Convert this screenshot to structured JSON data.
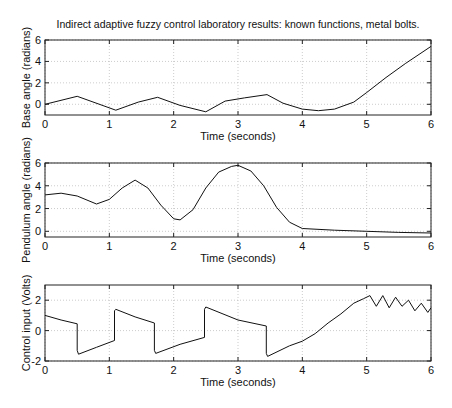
{
  "chart_data": [
    {
      "type": "line",
      "title": "Indirect adaptive fuzzy control laboratory results: known functions, metal bolts.",
      "xlabel": "Time (seconds)",
      "ylabel": "Base angle (radians)",
      "xlim": [
        0,
        6
      ],
      "ylim": [
        -1,
        6
      ],
      "xticks": [
        0,
        1,
        2,
        3,
        4,
        5,
        6
      ],
      "yticks": [
        0,
        2,
        4,
        6
      ],
      "grid": true,
      "series": [
        {
          "name": "Base angle",
          "x": [
            0,
            0.5,
            1.1,
            1.45,
            1.75,
            2.1,
            2.5,
            2.8,
            3.1,
            3.45,
            3.7,
            4.0,
            4.25,
            4.5,
            4.8,
            5.0,
            5.3,
            5.6,
            6.0
          ],
          "y": [
            0.0,
            0.75,
            -0.55,
            0.2,
            0.65,
            -0.1,
            -0.7,
            0.3,
            0.6,
            0.9,
            0.1,
            -0.45,
            -0.6,
            -0.45,
            0.2,
            1.1,
            2.5,
            3.8,
            5.4
          ]
        }
      ]
    },
    {
      "type": "line",
      "title": "",
      "xlabel": "Time (seconds)",
      "ylabel": "Pendulum angle (radians)",
      "xlim": [
        0,
        6
      ],
      "ylim": [
        -0.5,
        6
      ],
      "xticks": [
        0,
        1,
        2,
        3,
        4,
        5,
        6
      ],
      "yticks": [
        0,
        2,
        4,
        6
      ],
      "grid": true,
      "series": [
        {
          "name": "Pendulum angle",
          "x": [
            0,
            0.25,
            0.5,
            0.8,
            1.0,
            1.2,
            1.4,
            1.6,
            1.8,
            2.0,
            2.1,
            2.3,
            2.5,
            2.7,
            2.9,
            3.0,
            3.2,
            3.4,
            3.6,
            3.8,
            4.0,
            4.5,
            5.0,
            5.5,
            6.0
          ],
          "y": [
            3.2,
            3.35,
            3.1,
            2.4,
            2.8,
            3.8,
            4.5,
            3.8,
            2.3,
            1.1,
            1.0,
            1.9,
            3.8,
            5.2,
            5.7,
            5.8,
            5.3,
            4.0,
            2.1,
            0.8,
            0.25,
            0.1,
            0.0,
            -0.1,
            -0.15
          ]
        }
      ]
    },
    {
      "type": "line",
      "title": "",
      "xlabel": "Time (seconds)",
      "ylabel": "Control input (Volts)",
      "xlim": [
        0,
        6
      ],
      "ylim": [
        -2,
        3
      ],
      "xticks": [
        0,
        1,
        2,
        3,
        4,
        5,
        6
      ],
      "yticks": [
        -2,
        0,
        2
      ],
      "grid": true,
      "series": [
        {
          "name": "Control input",
          "x": [
            0,
            0.25,
            0.5,
            0.5,
            0.52,
            0.8,
            1.08,
            1.08,
            1.1,
            1.4,
            1.7,
            1.7,
            1.72,
            2.1,
            2.48,
            2.48,
            2.5,
            3.0,
            3.44,
            3.44,
            3.46,
            3.8,
            4.0,
            4.2,
            4.4,
            4.6,
            4.8,
            4.95,
            5.05,
            5.15,
            5.25,
            5.35,
            5.45,
            5.55,
            5.65,
            5.75,
            5.85,
            5.95,
            6.0
          ],
          "y": [
            1.0,
            0.7,
            0.45,
            -1.3,
            -1.55,
            -1.1,
            -0.65,
            1.3,
            1.4,
            0.9,
            0.5,
            -1.3,
            -1.5,
            -0.9,
            -0.45,
            1.4,
            1.55,
            0.7,
            0.3,
            -1.5,
            -1.7,
            -1.0,
            -0.7,
            -0.2,
            0.5,
            1.1,
            1.8,
            2.1,
            2.3,
            1.6,
            2.3,
            1.5,
            2.2,
            1.6,
            2.0,
            1.3,
            1.8,
            1.2,
            1.5
          ]
        }
      ]
    }
  ],
  "labels": {
    "title": "Indirect adaptive fuzzy control laboratory results: known functions, metal bolts.",
    "xlabel": "Time (seconds)",
    "ylabel_top": "Base angle (radians)",
    "ylabel_mid": "Pendulum angle (radians)",
    "ylabel_bot": "Control input (Volts)",
    "xticks": [
      "0",
      "1",
      "2",
      "3",
      "4",
      "5",
      "6"
    ],
    "yticks_top": [
      "6",
      "4",
      "2",
      "0"
    ],
    "yticks_mid": [
      "6",
      "4",
      "2",
      "0"
    ],
    "yticks_bot": [
      "2",
      "0",
      "-2"
    ]
  }
}
